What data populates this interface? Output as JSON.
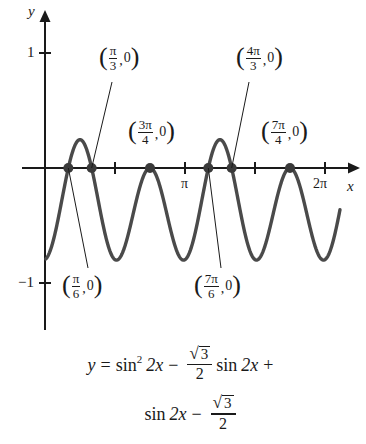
{
  "chart_data": {
    "type": "line",
    "title": "",
    "xlabel": "x",
    "ylabel": "y",
    "xlim": [
      -0.18,
      7.1
    ],
    "ylim": [
      -1.28,
      1.22
    ],
    "grid": false,
    "legend": null,
    "equation_text": "y = sin^2 2x - (sqrt(3)/2) sin 2x + sin 2x - sqrt(3)/2",
    "x_tick_labels": [
      "π",
      "2π"
    ],
    "x_tick_values": [
      3.14159,
      6.28319
    ],
    "x_minor_ticks": [
      1.5708,
      3.14159,
      4.71239,
      6.28319
    ],
    "y_tick_labels": [
      "1",
      "-1"
    ],
    "y_tick_values": [
      1,
      -1
    ],
    "series": [
      {
        "name": "y = (sin 2x + 1)(sin 2x - √3/2)",
        "x_domain": [
          0.02,
          6.62
        ],
        "sampled_y_extremes": {
          "local_max_small": 0.27,
          "local_min": -0.8,
          "tangent_zero": 0.0
        }
      }
    ],
    "annotations": [
      {
        "label": "(π/3, 0)",
        "num": "π",
        "den": "3",
        "x": 1.0472,
        "y": 0,
        "label_pos": "upper-left",
        "leader": true
      },
      {
        "label": "(4π/3, 0)",
        "num": "4π",
        "den": "3",
        "x": 4.18879,
        "y": 0,
        "label_pos": "upper-left",
        "leader": true
      },
      {
        "label": "(3π/4, 0)",
        "num": "3π",
        "den": "4",
        "x": 2.35619,
        "y": 0,
        "label_pos": "upper",
        "leader": false
      },
      {
        "label": "(7π/4, 0)",
        "num": "7π",
        "den": "4",
        "x": 5.49779,
        "y": 0,
        "label_pos": "upper",
        "leader": false
      },
      {
        "label": "(π/6, 0)",
        "num": "π",
        "den": "6",
        "x": 0.5236,
        "y": 0,
        "label_pos": "lower-right",
        "leader": true
      },
      {
        "label": "(7π/6, 0)",
        "num": "7π",
        "den": "6",
        "x": 3.66519,
        "y": 0,
        "label_pos": "lower-right",
        "leader": true
      }
    ],
    "marked_points": [
      {
        "x": 0.5236,
        "y": 0
      },
      {
        "x": 1.0472,
        "y": 0
      },
      {
        "x": 2.35619,
        "y": 0
      },
      {
        "x": 3.66519,
        "y": 0
      },
      {
        "x": 4.18879,
        "y": 0
      },
      {
        "x": 5.49779,
        "y": 0
      }
    ]
  },
  "axes": {
    "y_axis_label": "y",
    "x_axis_label": "x",
    "y_one_label": "1",
    "y_neg_one_label": "−1",
    "x_pi_label": "π",
    "x_two_pi_label": "2π"
  },
  "annotation_labels": {
    "pi_over_3": {
      "num": "π",
      "den": "3",
      "y_value": "0"
    },
    "four_pi_over_3": {
      "num": "4π",
      "den": "3",
      "y_value": "0"
    },
    "three_pi_over_4": {
      "num": "3π",
      "den": "4",
      "y_value": "0"
    },
    "seven_pi_over_4": {
      "num": "7π",
      "den": "4",
      "y_value": "0"
    },
    "pi_over_6": {
      "num": "π",
      "den": "6",
      "y_value": "0"
    },
    "seven_pi_over_6": {
      "num": "7π",
      "den": "6",
      "y_value": "0"
    }
  },
  "equation": {
    "lhs": "y",
    "equals": "=",
    "term1_fn": "sin",
    "term1_exp": "2",
    "term1_arg": "2x",
    "minus1": "−",
    "frac1_num_radical": "√",
    "frac1_num_radicand": "3",
    "frac1_den": "2",
    "term2_fn": "sin",
    "term2_arg": "2x",
    "plus": "+",
    "term3_fn": "sin",
    "term3_arg": "2x",
    "minus2": "−",
    "frac2_num_radical": "√",
    "frac2_num_radicand": "3",
    "frac2_den": "2"
  },
  "style": {
    "curve_color": "#4a4a4a",
    "axis_color": "#1a1a1a",
    "dot_color": "#3a3a3a",
    "background": "#ffffff"
  }
}
